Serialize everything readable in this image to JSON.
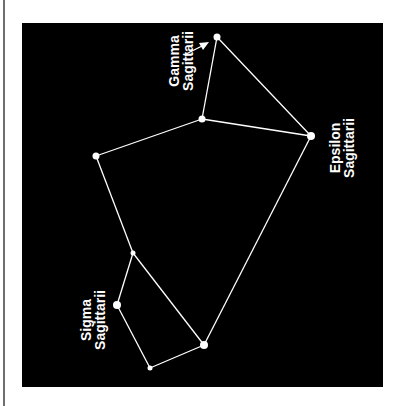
{
  "diagram": {
    "background": "#000000",
    "line_color": "#ffffff",
    "stars": [
      {
        "id": "gamma",
        "x": 217,
        "y": 37,
        "r": 3.5
      },
      {
        "id": "center",
        "x": 202,
        "y": 119,
        "r": 3.5
      },
      {
        "id": "epsilon",
        "x": 311,
        "y": 136,
        "r": 4
      },
      {
        "id": "west",
        "x": 96,
        "y": 156,
        "r": 3.5
      },
      {
        "id": "mid",
        "x": 133,
        "y": 253,
        "r": 2.5
      },
      {
        "id": "sigma",
        "x": 117,
        "y": 305,
        "r": 4
      },
      {
        "id": "southeast",
        "x": 204,
        "y": 345,
        "r": 4
      },
      {
        "id": "south",
        "x": 150,
        "y": 368,
        "r": 2.5
      }
    ],
    "edges": [
      [
        "gamma",
        "center"
      ],
      [
        "gamma",
        "epsilon"
      ],
      [
        "center",
        "epsilon"
      ],
      [
        "center",
        "west"
      ],
      [
        "west",
        "mid"
      ],
      [
        "mid",
        "southeast"
      ],
      [
        "mid",
        "sigma"
      ],
      [
        "sigma",
        "south"
      ],
      [
        "south",
        "southeast"
      ],
      [
        "southeast",
        "epsilon"
      ]
    ],
    "labels": {
      "gamma": {
        "line1": "Gamma",
        "line2": "Sagittarii"
      },
      "epsilon": {
        "line1": "Epsilon",
        "line2": "Sagittarii"
      },
      "sigma": {
        "line1": "Sigma",
        "line2": "Sagittarii"
      }
    }
  }
}
